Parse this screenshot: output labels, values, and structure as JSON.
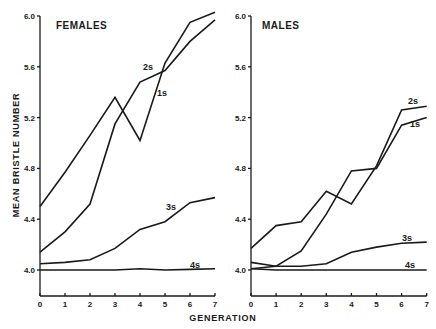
{
  "figure": {
    "ylabel": "MEAN BRISTLE NUMBER",
    "xlabel": "GENERATION"
  },
  "chart_data": [
    {
      "type": "line",
      "title": "FEMALES",
      "xlabel": "GENERATION",
      "ylabel": "MEAN BRISTLE NUMBER",
      "x": [
        0,
        1,
        2,
        3,
        4,
        5,
        6,
        7
      ],
      "xticks": [
        "0",
        "1",
        "2",
        "3",
        "4",
        "5",
        "6",
        "7"
      ],
      "yticks": [
        "4.0",
        "4.4",
        "4.8",
        "5.2",
        "5.6",
        "6.0"
      ],
      "ylim": [
        3.8,
        6.0
      ],
      "grid": false,
      "legend": "inline labels at line ends",
      "series": [
        {
          "name": "2s",
          "values": [
            4.5,
            4.77,
            5.06,
            5.36,
            5.02,
            5.63,
            5.95,
            6.03
          ]
        },
        {
          "name": "1s",
          "values": [
            4.14,
            4.3,
            4.52,
            5.15,
            5.48,
            5.57,
            5.8,
            5.97
          ]
        },
        {
          "name": "3s",
          "values": [
            4.05,
            4.06,
            4.08,
            4.17,
            4.32,
            4.38,
            4.53,
            4.57
          ]
        },
        {
          "name": "4s",
          "values": [
            4.0,
            4.0,
            4.0,
            4.0,
            4.01,
            4.0,
            4.005,
            4.01
          ]
        }
      ],
      "labels": [
        {
          "text": "2s",
          "x": 143,
          "y": 70
        },
        {
          "text": "1s",
          "x": 157,
          "y": 96
        },
        {
          "text": "3s",
          "x": 166,
          "y": 210
        },
        {
          "text": "4s",
          "x": 190,
          "y": 268
        }
      ]
    },
    {
      "type": "line",
      "title": "MALES",
      "xlabel": "GENERATION",
      "ylabel": "MEAN BRISTLE NUMBER",
      "x": [
        0,
        1,
        2,
        3,
        4,
        5,
        6,
        7
      ],
      "xticks": [
        "0",
        "1",
        "2",
        "3",
        "4",
        "5",
        "6",
        "7"
      ],
      "yticks": [
        "4.0",
        "4.4",
        "4.8",
        "5.2",
        "5.6",
        "6.0"
      ],
      "ylim": [
        3.8,
        6.0
      ],
      "grid": false,
      "legend": "inline labels at line ends",
      "series": [
        {
          "name": "2s",
          "values": [
            4.17,
            4.35,
            4.38,
            4.62,
            4.52,
            4.82,
            5.26,
            5.29
          ]
        },
        {
          "name": "1s",
          "values": [
            4.06,
            4.03,
            4.15,
            4.44,
            4.78,
            4.8,
            5.14,
            5.2
          ]
        },
        {
          "name": "3s",
          "values": [
            4.01,
            4.03,
            4.03,
            4.05,
            4.14,
            4.18,
            4.21,
            4.22
          ]
        },
        {
          "name": "4s",
          "values": [
            4.01,
            4.0,
            4.0,
            4.0,
            4.0,
            4.0,
            4.0,
            4.0
          ]
        }
      ],
      "labels": [
        {
          "text": "2s",
          "x": 408,
          "y": 104
        },
        {
          "text": "1s",
          "x": 410,
          "y": 127
        },
        {
          "text": "3s",
          "x": 402,
          "y": 241
        },
        {
          "text": "4s",
          "x": 405,
          "y": 268
        }
      ]
    }
  ]
}
